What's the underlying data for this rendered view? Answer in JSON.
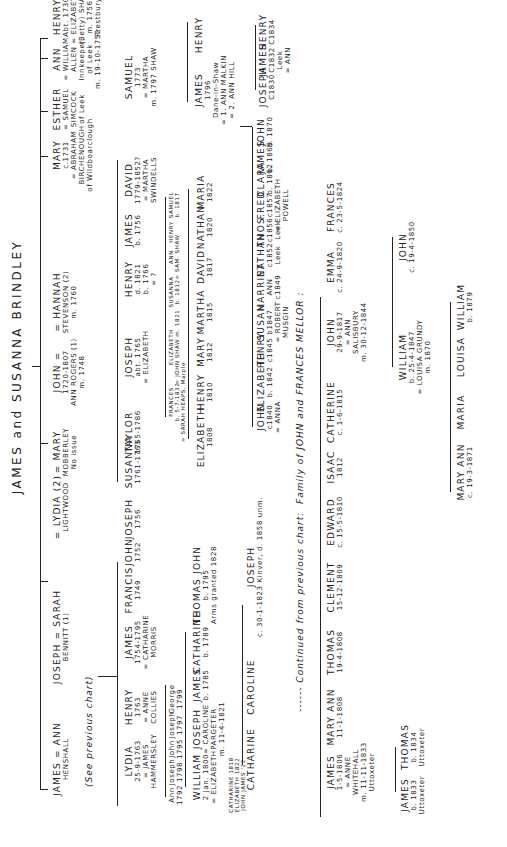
{
  "title": "JAMES and SUSANNA BRINDLEY",
  "notes": {
    "see_previous": "(See previous chart)",
    "continued": "------ Continued from previous chart:  Family of JOHN and FRANCES MELLOR :"
  },
  "generation1": [
    {
      "name": "JAMES = ANN",
      "detail": "HENSHALL"
    },
    {
      "name": "JOSEPH = SARAH",
      "detail": "BENNITT (1)"
    },
    {
      "name": "= LYDIA (2)",
      "detail": "LIGHTWOOD"
    },
    {
      "name": "= MARY",
      "detail": "MOBBERLEY\nNo issue"
    },
    {
      "name": "JOHN =",
      "detail": "1720-1807\nANN ROGERS (1)\nm. 1748"
    },
    {
      "name": "= HANNAH",
      "detail": "STEVENSON (2)\nm. 1760"
    },
    {
      "name": "MARY",
      "detail": "c.1731\n= ABRAHAM\nBIRCHENOUGH\nof Wildboarclough"
    },
    {
      "name": "ESTHER",
      "detail": "= SAMUEL\nSIMCOCK\nof Leek"
    },
    {
      "name": "ANN",
      "detail": "= WILLIAM\nALLEN\nInnkeeper,\nof Leek\nm. 19-10-1752"
    },
    {
      "name": "HENRY",
      "detail": "Abt. 1730\n= ELIZABETH\n(Betty) SHAW\nm. 1756\nPrestbury"
    }
  ],
  "joseph_children": [
    {
      "name": "LYDIA",
      "detail": "25-9-1763\n= JAMES\nHAMMERSLEY"
    },
    {
      "name": "HENRY",
      "detail": "1763\n= ANNE\nCOLLIES"
    },
    {
      "name": "JAMES",
      "detail": "1754-1795\n= CATHARINE\nMORRIS"
    },
    {
      "name": "FRANCIS",
      "detail": "1749"
    },
    {
      "name": "JOHN",
      "detail": "1752"
    },
    {
      "name": "JOSEPH",
      "detail": "1756"
    }
  ],
  "lydia_children": [
    {
      "name": "Ann",
      "detail": "1792"
    },
    {
      "name": "Joseph",
      "detail": "1798"
    },
    {
      "name": "John",
      "detail": "1795"
    },
    {
      "name": "Joseph",
      "detail": "1797"
    },
    {
      "name": "George",
      "detail": "1799"
    }
  ],
  "james_children": [
    {
      "name": "WILLIAM",
      "detail": "2 Jan. 1800\n= ELIZABETH"
    },
    {
      "name": "JOSEPH",
      "detail": "= CAROLINE\nPARGETER\nm. 11-4-1821"
    },
    {
      "name": "JAMES",
      "detail": "b. 1785"
    },
    {
      "name": "CATHARINE",
      "detail": "b. 1789"
    },
    {
      "name": "THOMAS JOHN",
      "detail": "b. 1795\nArms granted 1828"
    }
  ],
  "william_children_note": "CATHARINE 1818\nELIZABETH 1822\nJOHN JAMES '22",
  "joseph_children_gen": [
    {
      "name": "CATHARINE",
      "detail": ""
    },
    {
      "name": "CAROLINE",
      "detail": ""
    },
    {
      "name": "JOSEPH",
      "detail": "c. 30-1-1823 Kinver, d. 1858 unm."
    }
  ],
  "john_children": [
    {
      "name": "SUSANNA",
      "detail": "1761-1763"
    },
    {
      "name": "TAYLOR",
      "detail": "1765-1786"
    },
    {
      "name": "JOSEPH",
      "detail": "abt. 1765\n= ELIZABETH"
    },
    {
      "name": "HENRY",
      "detail": "d. 1821\nb. 1766\n= ?"
    },
    {
      "name": "JAMES",
      "detail": "b. 1756"
    },
    {
      "name": "DAVID",
      "detail": "1779-1852?\n= MARTHA\nSWINDELLS"
    },
    {
      "name": "SAMUEL",
      "detail": "1773\n= MARTHA\nm. 1797 SHAW"
    }
  ],
  "joseph1765_children": [
    {
      "name": "FRANCES",
      "detail": "b. 5-7-1832\n= SARAH HEAPS, Marple"
    },
    {
      "name": "ELIZABETH",
      "detail": "= JOHN SHAW m. 1821"
    },
    {
      "name": "SUSANNA",
      "detail": "b. 1812"
    },
    {
      "name": "ANN",
      "detail": "= SAM. SHAW"
    },
    {
      "name": "HENRY",
      "detail": ""
    },
    {
      "name": "SAMUEL",
      "detail": "b. 1817"
    }
  ],
  "henry_children": [
    {
      "name": "ELIZABETH",
      "detail": "1808"
    },
    {
      "name": "HENRY",
      "detail": "1810"
    },
    {
      "name": "MARY",
      "detail": "1812"
    },
    {
      "name": "MARTHA",
      "detail": "1815"
    },
    {
      "name": "DAVID",
      "detail": "1817"
    },
    {
      "name": "NATHAN",
      "detail": "1820"
    },
    {
      "name": "MARIA",
      "detail": "1822"
    }
  ],
  "samuel_children": [
    {
      "name": "JAMES",
      "detail": "1796\nDane-in-Shaw\n= 1. ANN MALKIN\n= 2. ANN HILL"
    },
    {
      "name": "HENRY",
      "detail": ""
    }
  ],
  "james1796_children_ann_hill": [
    {
      "name": "JOSEPH",
      "detail": "C1830"
    },
    {
      "name": "JAMES",
      "detail": "C1832\nLeek\n= ANN"
    },
    {
      "name": "HENRY",
      "detail": "C1834"
    }
  ],
  "james1796_children_malkin": [
    {
      "name": "JOHN",
      "detail": "c1840\n= ANNA"
    },
    {
      "name": "ELIZABETH",
      "detail": "b. 1842"
    },
    {
      "name": "HENRY",
      "detail": "c1845"
    },
    {
      "name": "SUSAN",
      "detail": "b1847\n= ROBERT\nMUSGIN"
    },
    {
      "name": "HARRIET",
      "detail": "ANN\nc1849"
    },
    {
      "name": "NATHAN",
      "detail": "c1852\nLeek"
    },
    {
      "name": "THOS.",
      "detail": "c1856\nLeek"
    },
    {
      "name": "FRED",
      "detail": "c1857\n= ELIZABETH\nPOWELL"
    },
    {
      "name": "CLARA",
      "detail": "b. 1862"
    },
    {
      "name": "JAMES",
      "detail": "b. 1869"
    },
    {
      "name": "JOHN",
      "detail": "b. 1870"
    }
  ],
  "mellor_children": [
    {
      "name": "JAMES",
      "detail": "1-5-1806\n= ANNE\nWHITEHALL\nm. 11-11-1833\nUttoxeter"
    },
    {
      "name": "MARY ANN",
      "detail": "11-1-1808"
    },
    {
      "name": "THOMAS",
      "detail": "19-4-1808"
    },
    {
      "name": "CLEMENT",
      "detail": "15-12-1809"
    },
    {
      "name": "EDWARD",
      "detail": "c. 15-5-1810"
    },
    {
      "name": "ISAAC",
      "detail": "1812"
    },
    {
      "name": "CATHERINE",
      "detail": "c. 1-6-1815"
    },
    {
      "name": "JOHN",
      "detail": "29-9-1817\n= ANN\nSALISBURY\nm. 30-12-1844"
    },
    {
      "name": "EMMA",
      "detail": "c. 24-9-1820"
    },
    {
      "name": "FRANCES",
      "detail": "c. 23-5-1824"
    }
  ],
  "james1806_children": [
    {
      "name": "JAMES",
      "detail": "b. 1833\nUttoxeter"
    },
    {
      "name": "THOMAS",
      "detail": "b. 1834\nUttoxeter"
    }
  ],
  "john1817_children": [
    {
      "name": "WILLIAM",
      "detail": "b. 25-4-1847\n= LOUISA GRUNDY\nm. 1870"
    },
    {
      "name": "JOHN",
      "detail": "c. 19-4-1850"
    }
  ],
  "william1847_children": [
    {
      "name": "MARY ANN",
      "detail": "c. 19-3-1871"
    },
    {
      "name": "MARIA",
      "detail": ""
    },
    {
      "name": "LOUISA",
      "detail": ""
    },
    {
      "name": "WILLIAM",
      "detail": "b. 1879"
    }
  ]
}
